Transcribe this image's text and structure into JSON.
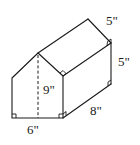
{
  "figure": {
    "type": "pentagonal prism (house-shaped)",
    "colors": {
      "line": "#1a1a1a",
      "background": "#ffffff"
    },
    "labels": {
      "base_width": "6\"",
      "height": "9\"",
      "depth": "8\"",
      "wall_height": "5\"",
      "roof_edge": "5\""
    }
  }
}
